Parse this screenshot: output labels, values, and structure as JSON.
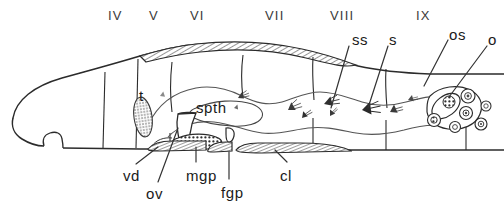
{
  "figure": {
    "kind": "anatomical-diagram",
    "caption": ""
  },
  "segment_labels": [
    {
      "text": "IV",
      "x": 108,
      "y": 9
    },
    {
      "text": "V",
      "x": 149,
      "y": 9
    },
    {
      "text": "VI",
      "x": 190,
      "y": 9
    },
    {
      "text": "VII",
      "x": 265,
      "y": 9
    },
    {
      "text": "VIII",
      "x": 330,
      "y": 9
    },
    {
      "text": "IX",
      "x": 416,
      "y": 9
    }
  ],
  "organ_labels": [
    {
      "key": "ss",
      "text": "ss",
      "x": 352,
      "y": 32
    },
    {
      "key": "s",
      "text": "s",
      "x": 389,
      "y": 32
    },
    {
      "key": "os",
      "text": "os",
      "x": 449,
      "y": 27
    },
    {
      "key": "o",
      "text": "o",
      "x": 488,
      "y": 32
    },
    {
      "key": "t",
      "text": "t",
      "x": 139,
      "y": 88
    },
    {
      "key": "spth",
      "text": "spth",
      "x": 196,
      "y": 100
    },
    {
      "key": "vd",
      "text": "vd",
      "x": 123,
      "y": 168
    },
    {
      "key": "ov",
      "text": "ov",
      "x": 146,
      "y": 186
    },
    {
      "key": "mgp",
      "text": "mgp",
      "x": 186,
      "y": 168
    },
    {
      "key": "fgp",
      "text": "fgp",
      "x": 221,
      "y": 185
    },
    {
      "key": "cl",
      "text": "cl",
      "x": 280,
      "y": 168
    }
  ],
  "leader_lines": [
    {
      "key": "ss",
      "x1": 349,
      "y1": 46,
      "x2": 331,
      "y2": 108
    },
    {
      "key": "s",
      "x1": 388,
      "y1": 46,
      "x2": 368,
      "y2": 108
    },
    {
      "key": "os",
      "x1": 448,
      "y1": 40,
      "x2": 424,
      "y2": 86
    },
    {
      "key": "o",
      "x1": 487,
      "y1": 46,
      "x2": 449,
      "y2": 97
    },
    {
      "key": "vd",
      "x1": 136,
      "y1": 164,
      "x2": 158,
      "y2": 147
    },
    {
      "key": "ov",
      "x1": 158,
      "y1": 182,
      "x2": 178,
      "y2": 128
    },
    {
      "key": "mgp",
      "x1": 196,
      "y1": 162,
      "x2": 196,
      "y2": 147
    },
    {
      "key": "fgp",
      "x1": 229,
      "y1": 179,
      "x2": 229,
      "y2": 152
    },
    {
      "key": "cl",
      "x1": 287,
      "y1": 162,
      "x2": 275,
      "y2": 150
    }
  ],
  "colors": {
    "ink": "#1a1a1a",
    "outline": "#2b2b2b",
    "hatch": "#4a4a4a",
    "stipple": "#555555",
    "background": "#ffffff"
  },
  "structures": [
    {
      "key": "body-wall",
      "name": "body wall outline"
    },
    {
      "key": "clitellum",
      "name": "dorsal clitellum (hatched band)"
    },
    {
      "key": "ventral-band",
      "name": "ventral hatched bands"
    },
    {
      "key": "septa",
      "name": "segmental septa"
    },
    {
      "key": "testis",
      "name": "testis (t)"
    },
    {
      "key": "spermatheca",
      "name": "spermatheca (spth)"
    },
    {
      "key": "sperm-sac",
      "name": "seminal vesicle / sperm sac (ss)"
    },
    {
      "key": "sperm",
      "name": "sperm masses (s)"
    },
    {
      "key": "ovary",
      "name": "ovary (o)"
    },
    {
      "key": "ovisac",
      "name": "ovisac (os)"
    },
    {
      "key": "vas-deferens",
      "name": "vas deferens (vd)"
    },
    {
      "key": "oviduct",
      "name": "oviduct (ov)"
    },
    {
      "key": "male-pore",
      "name": "male genital pore (mgp)"
    },
    {
      "key": "female-pore",
      "name": "female genital pore (fgp)"
    }
  ]
}
